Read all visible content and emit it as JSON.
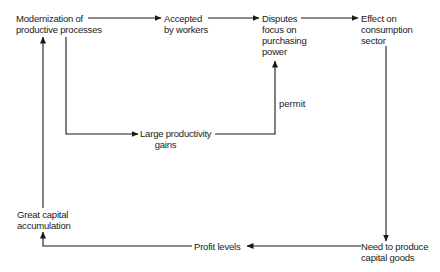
{
  "diagram": {
    "type": "flowchart",
    "nodes": [
      {
        "id": "modernization",
        "label": "Modernization of\nproductive processes"
      },
      {
        "id": "accepted",
        "label": "Accepted\nby workers"
      },
      {
        "id": "disputes",
        "label": "Disputes\nfocus on\npurchasing\npower"
      },
      {
        "id": "effect",
        "label": "Effect on\nconsumption\nsector"
      },
      {
        "id": "productivity",
        "label": "Large productivity\ngains"
      },
      {
        "id": "need",
        "label": "Need to produce\ncapital goods"
      },
      {
        "id": "profit",
        "label": "Profit levels"
      },
      {
        "id": "capital",
        "label": "Great capital\naccumulation"
      }
    ],
    "edges": [
      {
        "from": "modernization",
        "to": "accepted",
        "label": ""
      },
      {
        "from": "accepted",
        "to": "disputes",
        "label": ""
      },
      {
        "from": "disputes",
        "to": "effect",
        "label": ""
      },
      {
        "from": "modernization",
        "to": "productivity",
        "label": ""
      },
      {
        "from": "productivity",
        "to": "disputes",
        "label": "permit"
      },
      {
        "from": "effect",
        "to": "need",
        "label": ""
      },
      {
        "from": "need",
        "to": "profit",
        "label": ""
      },
      {
        "from": "profit",
        "to": "capital",
        "label": ""
      },
      {
        "from": "capital",
        "to": "modernization",
        "label": ""
      }
    ]
  },
  "labels": {
    "modernization": "Modernization of\nproductive processes",
    "accepted": "Accepted\nby workers",
    "disputes": "Disputes\nfocus on\npurchasing\npower",
    "effect": "Effect on\nconsumption\nsector",
    "productivity": "Large productivity\n      gains",
    "need": "Need to produce\ncapital goods",
    "profit": "Profit levels",
    "capital": "Great capital\naccumulation",
    "permit": "permit"
  },
  "colors": {
    "line": "#1a1a1a",
    "background": "#ffffff"
  }
}
